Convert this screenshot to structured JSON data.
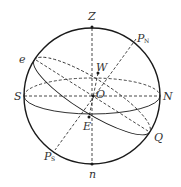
{
  "figure": {
    "colors": {
      "line": "#1a1a1a",
      "text": "#333333",
      "background": "#ffffff"
    },
    "labels": {
      "zenith": "Z",
      "nadir": "n",
      "north": "N",
      "south": "S",
      "east": "E",
      "west": "W",
      "center": "O",
      "equator_left": "e",
      "equator_right": "Q",
      "north_pole": "P",
      "north_pole_sub": "N",
      "south_pole": "P",
      "south_pole_sub": "S"
    }
  }
}
